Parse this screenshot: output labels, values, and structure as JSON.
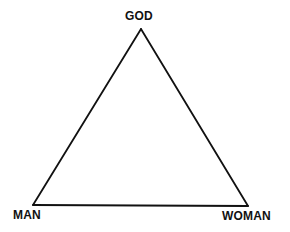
{
  "diagram": {
    "type": "triangle",
    "vertices": {
      "top": {
        "label": "GOD",
        "x": 141,
        "y": 29
      },
      "bottom_left": {
        "label": "MAN",
        "x": 33,
        "y": 205
      },
      "bottom_right": {
        "label": "WOMAN",
        "x": 248,
        "y": 206
      }
    },
    "stroke_color": "#111111",
    "background_color": "#ffffff"
  },
  "labels": {
    "top": "GOD",
    "bottom_left": "MAN",
    "bottom_right": "WOMAN"
  }
}
